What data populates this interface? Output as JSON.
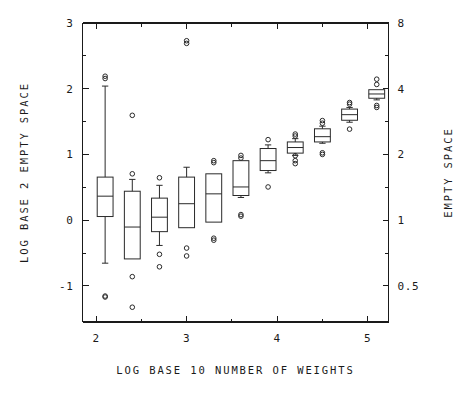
{
  "chart_data": {
    "type": "box",
    "title": "",
    "xlabel": "LOG BASE 10 NUMBER OF WEIGHTS",
    "ylabel": "LOG BASE 2 EMPTY SPACE",
    "y2label": "EMPTY SPACE",
    "xlim": [
      1.85,
      5.23
    ],
    "ylim": [
      -1.55,
      3.0
    ],
    "grid": false,
    "legend": null,
    "xticks": [
      2,
      3,
      4,
      5
    ],
    "xtick_labels": [
      "2",
      "3",
      "4",
      "5"
    ],
    "xminor_ticks": [
      2.5,
      3.5,
      4.5
    ],
    "yticks": [
      -1,
      0,
      1,
      2,
      3
    ],
    "ytick_labels": [
      "-1",
      "0",
      "1",
      "2",
      "3"
    ],
    "yminor_ticks": [
      -0.5,
      0.5,
      1.5,
      2.5
    ],
    "y2ticks": [
      -1,
      0,
      1,
      2,
      3
    ],
    "y2tick_labels": [
      "0.5",
      "1",
      "2",
      "4",
      "8"
    ],
    "y2minor_ticks": [
      -0.5,
      0.5,
      1.5,
      2.5
    ],
    "box_width": 0.175,
    "boxes": [
      {
        "x": 2.1,
        "whisker_low": -0.655,
        "q1": 0.055,
        "median": 0.365,
        "q3": 0.655,
        "whisker_high": 2.04,
        "outliers": [
          -1.155,
          -1.17,
          2.155,
          2.19
        ]
      },
      {
        "x": 2.4,
        "whisker_low": -0.59,
        "q1": -0.59,
        "median": -0.105,
        "q3": 0.44,
        "whisker_high": 0.62,
        "outliers": [
          -1.325,
          -0.86,
          0.705,
          1.595
        ]
      },
      {
        "x": 2.7,
        "whisker_low": -0.385,
        "q1": -0.175,
        "median": 0.045,
        "q3": 0.335,
        "whisker_high": 0.53,
        "outliers": [
          -0.71,
          -0.52,
          0.645
        ]
      },
      {
        "x": 3.0,
        "whisker_low": -0.115,
        "q1": -0.115,
        "median": 0.25,
        "q3": 0.655,
        "whisker_high": 0.805,
        "outliers": [
          -0.545,
          -0.425,
          2.69,
          2.73
        ]
      },
      {
        "x": 3.3,
        "whisker_low": -0.03,
        "q1": -0.03,
        "median": 0.4,
        "q3": 0.705,
        "whisker_high": 0.705,
        "outliers": [
          -0.305,
          -0.275,
          0.875,
          0.905
        ]
      },
      {
        "x": 3.6,
        "whisker_low": 0.345,
        "q1": 0.375,
        "median": 0.505,
        "q3": 0.905,
        "whisker_high": 0.905,
        "outliers": [
          0.06,
          0.085,
          0.945,
          0.985
        ]
      },
      {
        "x": 3.9,
        "whisker_low": 0.72,
        "q1": 0.755,
        "median": 0.905,
        "q3": 1.09,
        "whisker_high": 1.145,
        "outliers": [
          0.505,
          1.225
        ]
      },
      {
        "x": 4.2,
        "whisker_low": 0.985,
        "q1": 1.02,
        "median": 1.105,
        "q3": 1.19,
        "whisker_high": 1.24,
        "outliers": [
          0.86,
          0.905,
          0.98,
          1.28,
          1.31
        ]
      },
      {
        "x": 4.5,
        "whisker_low": 1.17,
        "q1": 1.19,
        "median": 1.27,
        "q3": 1.39,
        "whisker_high": 1.43,
        "outliers": [
          1.0,
          1.025,
          1.475,
          1.515
        ]
      },
      {
        "x": 4.8,
        "whisker_low": 1.49,
        "q1": 1.52,
        "median": 1.605,
        "q3": 1.69,
        "whisker_high": 1.715,
        "outliers": [
          1.385,
          1.765,
          1.79
        ]
      },
      {
        "x": 5.1,
        "whisker_low": 1.83,
        "q1": 1.855,
        "median": 1.92,
        "q3": 1.985,
        "whisker_high": 1.985,
        "outliers": [
          1.715,
          1.745,
          2.065,
          2.145
        ]
      }
    ]
  },
  "colors": {
    "axis": "#1a1a1a",
    "box": "#2a2a2a",
    "background": "#ffffff"
  }
}
